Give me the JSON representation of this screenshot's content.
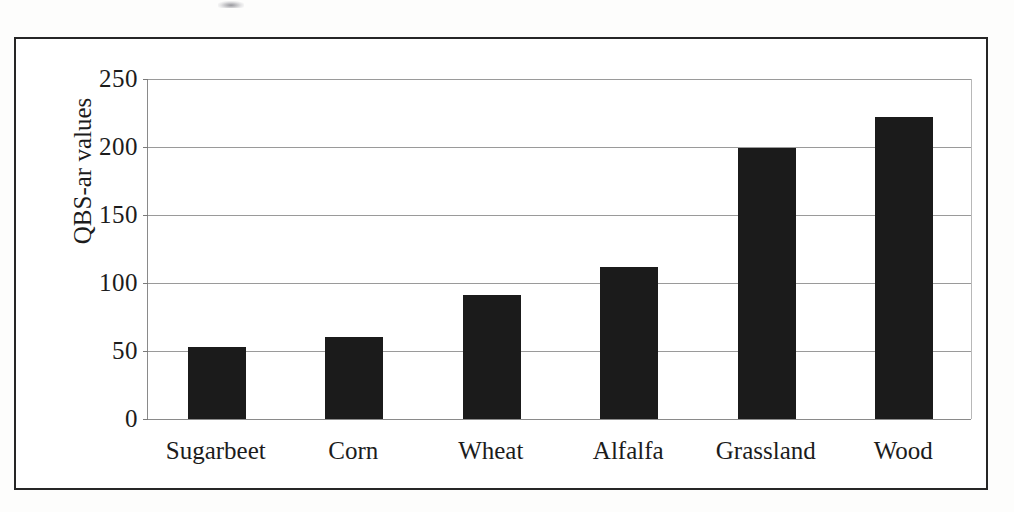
{
  "chart_data": {
    "type": "bar",
    "title": "",
    "xlabel": "",
    "ylabel": "QBS-ar values",
    "categories": [
      "Sugarbeet",
      "Corn",
      "Wheat",
      "Alfalfa",
      "Grassland",
      "Wood"
    ],
    "values": [
      53,
      60,
      91,
      112,
      199,
      222
    ],
    "ylim": [
      0,
      250
    ],
    "yticks": [
      0,
      50,
      100,
      150,
      200,
      250
    ],
    "ytick_labels": [
      "0",
      "50",
      "100",
      "150",
      "200",
      "250"
    ],
    "grid": true,
    "legend": false,
    "legend_position": "none",
    "bar_color": "#1b1b1b",
    "gridline_color": "#9a9a9a",
    "axis_color": "#8a8a8a",
    "frame_color": "#262626",
    "background_color": "#ffffff"
  },
  "figure": {
    "frame_label": "figure-border"
  }
}
